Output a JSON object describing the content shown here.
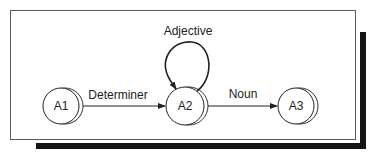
{
  "diagram": {
    "type": "state-transition",
    "nodes": [
      {
        "id": "A1",
        "label": "A1"
      },
      {
        "id": "A2",
        "label": "A2"
      },
      {
        "id": "A3",
        "label": "A3"
      }
    ],
    "edges": [
      {
        "from": "A1",
        "to": "A2",
        "label": "Determiner"
      },
      {
        "from": "A2",
        "to": "A2",
        "label": "Adjective"
      },
      {
        "from": "A2",
        "to": "A3",
        "label": "Noun"
      }
    ]
  },
  "colors": {
    "stroke": "#222222",
    "frame": "#5a5a5a",
    "shadow": "#151515",
    "background": "#ffffff"
  }
}
